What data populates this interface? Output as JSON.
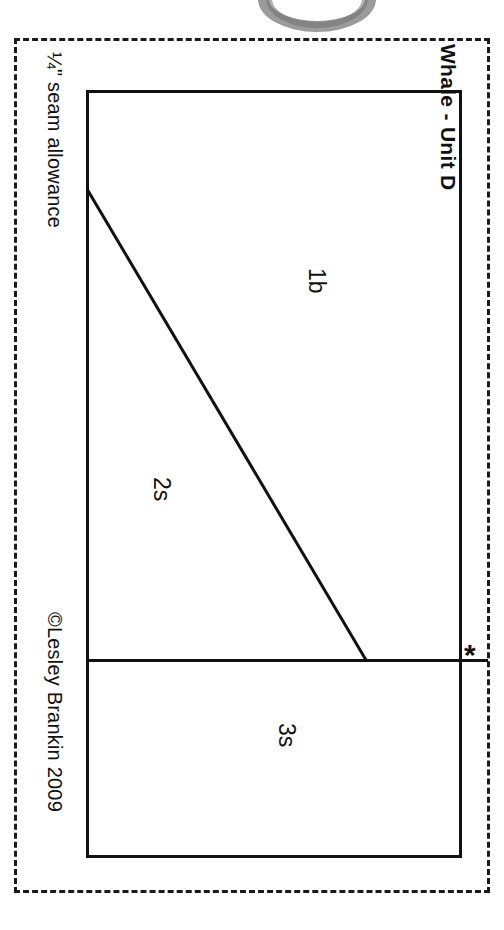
{
  "document": {
    "type": "quilt-block-pattern-sheet",
    "title": "Whale - Unit D",
    "seam_allowance_note": "¼\" seam allowance",
    "copyright": "©Lesley Brankin 2009",
    "reference_mark": "*"
  },
  "pattern": {
    "pieces": [
      {
        "label": "1b",
        "region": "upper-right triangle"
      },
      {
        "label": "2s",
        "region": "lower-left triangle"
      },
      {
        "label": "3s",
        "region": "bottom rectangle"
      }
    ],
    "colors": {
      "line": "#111111",
      "dashed_boundary": "#1b1b1b",
      "paper": "#ffffff",
      "scan_artifact_grey": "#8a8a8a"
    }
  },
  "icons": {
    "ring_artifact": "ring-arc-icon"
  }
}
